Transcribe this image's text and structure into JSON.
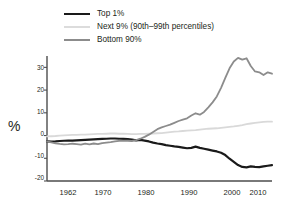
{
  "chart_data": {
    "type": "line",
    "title": "",
    "xlabel": "",
    "ylabel": "%",
    "xlim": [
      1962,
      2015
    ],
    "ylim": [
      -20,
      35
    ],
    "yticks": [
      -20,
      -10,
      0,
      10,
      20,
      30
    ],
    "xticks": [
      1962,
      1970,
      1980,
      1990,
      2000,
      2010
    ],
    "grid": false,
    "legend_position": "top-left",
    "x": [
      1962,
      1963,
      1964,
      1965,
      1966,
      1967,
      1968,
      1969,
      1970,
      1971,
      1972,
      1973,
      1974,
      1975,
      1976,
      1977,
      1978,
      1979,
      1980,
      1981,
      1982,
      1983,
      1984,
      1985,
      1986,
      1987,
      1988,
      1989,
      1990,
      1991,
      1992,
      1993,
      1994,
      1995,
      1996,
      1997,
      1998,
      1999,
      2000,
      2001,
      2002,
      2003,
      2004,
      2005,
      2006,
      2007,
      2008,
      2009,
      2010,
      2011,
      2012,
      2013,
      2014,
      2015
    ],
    "series": [
      {
        "name": "Top 1%",
        "color": "#1a1a1a",
        "width": 2.2,
        "values": [
          -2.6,
          -2.7,
          -2.6,
          -2.4,
          -2.3,
          -2.2,
          -2.2,
          -2.1,
          -2.0,
          -1.9,
          -1.8,
          -1.7,
          -1.6,
          -1.5,
          -1.4,
          -1.3,
          -1.3,
          -1.4,
          -1.5,
          -1.6,
          -1.8,
          -2.1,
          -1.9,
          -2.2,
          -2.6,
          -3.1,
          -3.5,
          -3.8,
          -4.2,
          -4.5,
          -4.8,
          -5.0,
          -5.3,
          -5.6,
          -5.4,
          -4.9,
          -5.4,
          -5.8,
          -6.2,
          -6.6,
          -7.0,
          -7.6,
          -8.6,
          -10.2,
          -11.6,
          -13.0,
          -13.8,
          -14.0,
          -13.6,
          -13.8,
          -13.9,
          -13.6,
          -13.3,
          -13.0
        ]
      },
      {
        "name": "Next 9% (90th–99th percentiles)",
        "color": "#d9d9d9",
        "width": 1.8,
        "values": [
          -0.4,
          -0.3,
          -0.2,
          0.0,
          0.1,
          0.2,
          0.3,
          0.3,
          0.4,
          0.4,
          0.5,
          0.6,
          0.7,
          0.7,
          0.8,
          0.9,
          0.9,
          0.8,
          0.8,
          0.7,
          0.6,
          0.6,
          0.7,
          0.7,
          0.8,
          0.9,
          1.0,
          1.1,
          1.3,
          1.5,
          1.7,
          1.8,
          2.0,
          2.2,
          2.3,
          2.4,
          2.6,
          2.8,
          3.0,
          3.1,
          3.2,
          3.4,
          3.6,
          3.8,
          4.0,
          4.3,
          4.6,
          5.0,
          5.3,
          5.6,
          5.8,
          6.0,
          6.1,
          6.1
        ]
      },
      {
        "name": "Bottom 90%",
        "color": "#8c8c8c",
        "width": 1.8,
        "values": [
          -2.6,
          -3.0,
          -3.4,
          -3.7,
          -3.9,
          -3.8,
          -3.6,
          -3.8,
          -4.0,
          -3.6,
          -3.9,
          -3.5,
          -3.8,
          -3.3,
          -3.1,
          -2.9,
          -2.6,
          -2.3,
          -2.2,
          -2.3,
          -2.4,
          -2.0,
          -1.4,
          -0.6,
          0.4,
          1.6,
          2.8,
          3.6,
          4.2,
          4.8,
          5.6,
          6.4,
          7.0,
          7.6,
          8.8,
          9.8,
          9.2,
          10.4,
          12.4,
          14.6,
          17.2,
          21.0,
          25.4,
          29.6,
          32.6,
          34.2,
          33.4,
          34.0,
          30.6,
          28.2,
          27.8,
          26.6,
          27.8,
          27.2
        ]
      }
    ]
  },
  "legend": {
    "items": [
      {
        "label": "Top 1%"
      },
      {
        "label": "Next 9% (90th–99th percentiles)"
      },
      {
        "label": "Bottom 90%"
      }
    ]
  },
  "axes": {
    "y_label": "%",
    "y_tick_labels": [
      "30",
      "20",
      "10",
      "0",
      "-10",
      "-20"
    ],
    "x_tick_labels": [
      "1962",
      "1970",
      "1980",
      "1990",
      "2000",
      "2010"
    ]
  }
}
